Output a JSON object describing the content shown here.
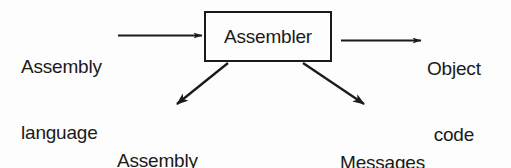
{
  "diagram": {
    "background_color": "#fdfdfd",
    "stroke_color": "#1a1a1a",
    "process": {
      "box_label": "Assembler"
    },
    "inputs": [
      {
        "id": "assembly-language",
        "line1": "Assembly",
        "line2": "language"
      }
    ],
    "outputs": [
      {
        "id": "object-code",
        "line1": "Object",
        "line2": "code"
      },
      {
        "id": "assembly-listing",
        "line1": "Assembly",
        "line2": "listing"
      },
      {
        "id": "messages",
        "line1": "Messages",
        "line2": ""
      }
    ],
    "arrows": [
      {
        "id": "arrow-input-to-assembler",
        "direction": "right"
      },
      {
        "id": "arrow-assembler-to-object-code",
        "direction": "right"
      },
      {
        "id": "arrow-assembler-to-assembly-listing",
        "direction": "down-left"
      },
      {
        "id": "arrow-assembler-to-messages",
        "direction": "down-right"
      }
    ]
  }
}
